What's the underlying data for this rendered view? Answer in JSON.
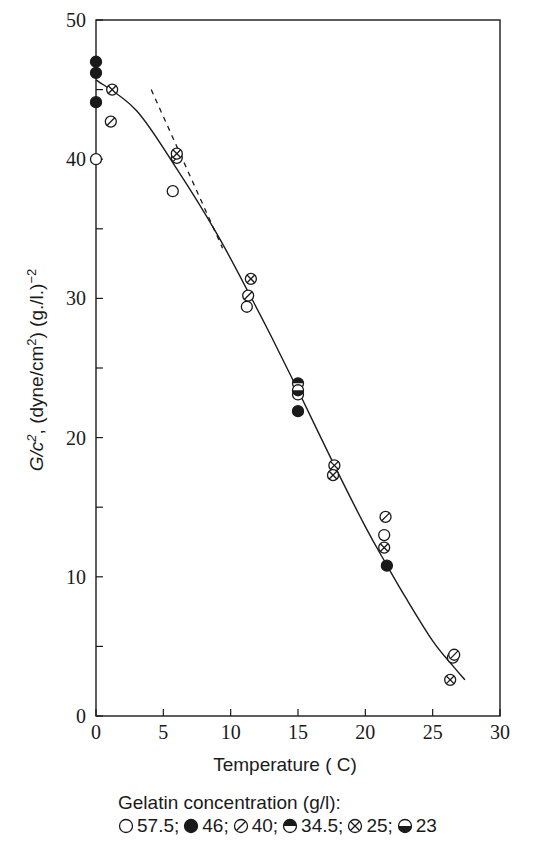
{
  "chart_data": {
    "type": "scatter",
    "title": "",
    "xlabel": "Temperature ( C)",
    "ylabel": "G/c², (dyne/cm²) (g./l.)⁻²",
    "ylabel_parts": {
      "main": "G/c",
      "sup1": "2",
      "mid": ", (dyne/cm",
      "sup2": "2",
      "tail": ") (g./l.)",
      "sup3": "−2"
    },
    "xlim": [
      0,
      30
    ],
    "ylim": [
      0,
      50
    ],
    "x_ticks": [
      0,
      5,
      10,
      15,
      20,
      25,
      30
    ],
    "y_ticks_labeled": [
      0,
      10,
      20,
      30,
      40,
      50
    ],
    "y_ticks_minor": [
      5,
      15,
      25,
      35,
      45
    ],
    "grid": false,
    "legend_position": "below",
    "legend_title": "Gelatin concentration (g/l):",
    "series": [
      {
        "name": "57.5",
        "marker": "open-circle",
        "points": [
          [
            0,
            40.0
          ],
          [
            5.7,
            37.7
          ],
          [
            11.2,
            29.4
          ],
          [
            15.0,
            23.1
          ],
          [
            21.4,
            13.0
          ],
          [
            26.5,
            4.2
          ]
        ]
      },
      {
        "name": "46",
        "marker": "filled-circle",
        "points": [
          [
            0,
            47.0
          ],
          [
            0,
            46.2
          ],
          [
            0,
            44.1
          ],
          [
            15.0,
            21.9
          ],
          [
            21.6,
            10.8
          ]
        ]
      },
      {
        "name": "40",
        "marker": "slashed-circle",
        "points": [
          [
            1.1,
            42.7
          ],
          [
            6.0,
            40.1
          ],
          [
            11.3,
            30.2
          ],
          [
            21.5,
            14.3
          ],
          [
            26.6,
            4.4
          ]
        ]
      },
      {
        "name": "34.5",
        "marker": "top-half-filled-circle",
        "points": [
          [
            15.0,
            23.9
          ]
        ]
      },
      {
        "name": "25",
        "marker": "crossed-circle",
        "points": [
          [
            1.2,
            45.0
          ],
          [
            6.0,
            40.4
          ],
          [
            11.5,
            31.4
          ],
          [
            17.7,
            18.0
          ],
          [
            17.6,
            17.3
          ],
          [
            21.4,
            12.1
          ],
          [
            26.3,
            2.6
          ]
        ]
      },
      {
        "name": "23",
        "marker": "bottom-half-filled-circle",
        "points": [
          [
            15.0,
            23.4
          ]
        ]
      }
    ],
    "fit_curve": {
      "style": "solid",
      "points": [
        [
          0,
          45.7
        ],
        [
          3,
          43.5
        ],
        [
          6,
          39.3
        ],
        [
          9,
          34.6
        ],
        [
          11.5,
          30.1
        ],
        [
          13,
          27.3
        ],
        [
          15,
          23.4
        ],
        [
          17.5,
          18.4
        ],
        [
          20,
          13.6
        ],
        [
          21.5,
          11.0
        ],
        [
          23,
          8.5
        ],
        [
          25,
          5.4
        ],
        [
          26.5,
          3.6
        ],
        [
          27.4,
          2.6
        ]
      ]
    },
    "tangent_line": {
      "style": "dashed",
      "points": [
        [
          4.1,
          45.0
        ],
        [
          9.4,
          33.6
        ]
      ]
    }
  },
  "legend": {
    "title": "Gelatin concentration (g/l):",
    "items": [
      {
        "marker": "open-circle",
        "label": "57.5;"
      },
      {
        "marker": "filled-circle",
        "label": "46;"
      },
      {
        "marker": "slashed-circle",
        "label": "40;"
      },
      {
        "marker": "top-half-filled-circle",
        "label": "34.5;"
      },
      {
        "marker": "crossed-circle",
        "label": "25;"
      },
      {
        "marker": "bottom-half-filled-circle",
        "label": "23"
      }
    ]
  }
}
